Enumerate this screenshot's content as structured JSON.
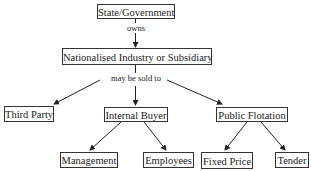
{
  "diagram": {
    "nodes": {
      "root": "State/Government",
      "industry": "Nationalised Industry or Subsidiary",
      "third_party": "Third Party",
      "internal_buyer": "Internal Buyer",
      "public_flotation": "Public Flotation",
      "management": "Management",
      "employees": "Employees",
      "fixed_price": "Fixed Price",
      "tender": "Tender"
    },
    "edge_labels": {
      "owns": "owns",
      "may_be_sold_to": "may be sold to"
    },
    "edges": [
      {
        "from": "root",
        "to": "industry",
        "label": "owns"
      },
      {
        "from": "industry",
        "to": "third_party",
        "label": "may be sold to"
      },
      {
        "from": "industry",
        "to": "internal_buyer",
        "label": "may be sold to"
      },
      {
        "from": "industry",
        "to": "public_flotation",
        "label": "may be sold to"
      },
      {
        "from": "internal_buyer",
        "to": "management"
      },
      {
        "from": "internal_buyer",
        "to": "employees"
      },
      {
        "from": "public_flotation",
        "to": "fixed_price"
      },
      {
        "from": "public_flotation",
        "to": "tender"
      }
    ]
  }
}
